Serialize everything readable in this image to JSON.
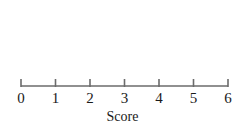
{
  "chart_data": {
    "type": "dotplot",
    "title": "",
    "subtitle": "",
    "xlabel": "Score",
    "ylabel": "",
    "categories": [
      "0",
      "1",
      "2",
      "3",
      "4",
      "5",
      "6"
    ],
    "values": [
      0,
      1,
      5,
      7,
      5,
      2,
      0
    ],
    "x": [
      0,
      1,
      2,
      3,
      4,
      5,
      6
    ],
    "counts": [
      0,
      1,
      5,
      7,
      5,
      2,
      0
    ],
    "total_count": 20,
    "xlim": [
      0,
      6
    ],
    "ylim": [
      0,
      7
    ],
    "grid": false,
    "legend": "none",
    "tick_labels": [
      "0",
      "1",
      "2",
      "3",
      "4",
      "5",
      "6"
    ],
    "annotations": [],
    "dot_color": "#111111",
    "axis_color": "#6b6b6b",
    "background_color": "#ffffff"
  },
  "axis": {
    "title": "Score",
    "ticks": [
      {
        "label": "0",
        "value": 0
      },
      {
        "label": "1",
        "value": 1
      },
      {
        "label": "2",
        "value": 2
      },
      {
        "label": "3",
        "value": 3
      },
      {
        "label": "4",
        "value": 4
      },
      {
        "label": "5",
        "value": 5
      },
      {
        "label": "6",
        "value": 6
      }
    ]
  }
}
